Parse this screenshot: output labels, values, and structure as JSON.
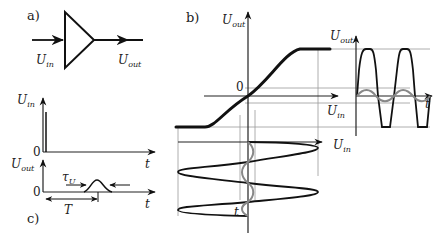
{
  "panels": {
    "a": {
      "label": "a)",
      "input_label": "U",
      "input_sub": "in",
      "output_label": "U",
      "output_sub": "out"
    },
    "b": {
      "label": "b)",
      "transfer_y_label": "U",
      "transfer_y_sub": "out",
      "transfer_x_label": "U",
      "transfer_x_sub": "in",
      "origin": "0",
      "input_axis_label": "U",
      "input_axis_sub": "in",
      "time_label": "t",
      "output_plot_y_label": "U",
      "output_plot_y_sub": "out",
      "output_plot_x_label": "U",
      "output_plot_x_sub": "in",
      "output_plot_t_label": "t"
    },
    "c": {
      "label": "c)",
      "top_y_label": "U",
      "top_y_sub": "in",
      "top_origin": "0",
      "top_t_label": "t",
      "bottom_y_label": "U",
      "bottom_y_sub": "out",
      "bottom_origin": "0",
      "bottom_t_label": "t",
      "tau_label": "τ",
      "tau_sub": "U",
      "period_label": "T"
    }
  },
  "colors": {
    "ink": "#111111",
    "grid": "#999999",
    "small_signal": "#888888"
  }
}
